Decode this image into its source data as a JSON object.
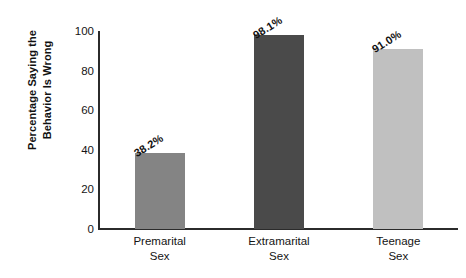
{
  "chart_data": {
    "type": "bar",
    "title": "",
    "subtitle": "",
    "xlabel": "",
    "ylabel": "Percentage Saying the Behavior Is Wrong",
    "ylabel_lines": [
      "Percentage Saying the",
      "Behavior Is Wrong"
    ],
    "categories": [
      "Premarital Sex",
      "Extramarital Sex",
      "Teenage Sex"
    ],
    "category_lines": [
      [
        "Premarital",
        "Sex"
      ],
      [
        "Extramarital",
        "Sex"
      ],
      [
        "Teenage",
        "Sex"
      ]
    ],
    "values": [
      38.2,
      98.1,
      91.0
    ],
    "value_labels": [
      "38.2%",
      "98.1%",
      "91.0%"
    ],
    "bar_colors": [
      "#848484",
      "#4a4a4a",
      "#c0c0c0"
    ],
    "ylim": [
      0,
      100
    ],
    "yticks": [
      0,
      20,
      40,
      60,
      80,
      100
    ],
    "ytick_labels": [
      "0",
      "20",
      "40",
      "60",
      "80",
      "100"
    ],
    "grid": false,
    "legend": false,
    "legend_position": "none",
    "axis_color": "#2b2b2b",
    "background_color": "#ffffff",
    "value_label_rotation_deg": -32
  }
}
